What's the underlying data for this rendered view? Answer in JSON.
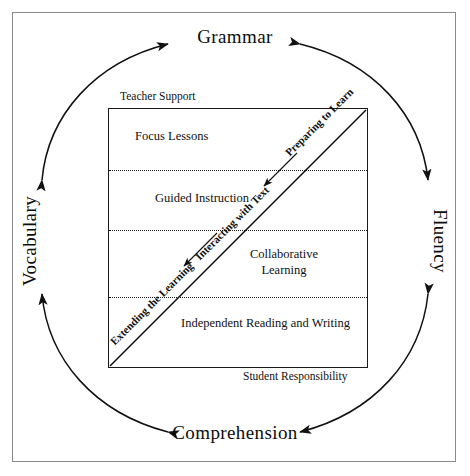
{
  "diagram": {
    "cycle": {
      "top_label": "Grammar",
      "bottom_label": "Comprehension",
      "left_label": "Vocabulary",
      "right_label": "Fluency"
    },
    "square": {
      "top_caption": "Teacher Support",
      "bottom_caption": "Student Responsibility",
      "bands": [
        {
          "label": "Focus Lessons"
        },
        {
          "label": "Guided Instruction"
        },
        {
          "label": "Collaborative Learning"
        },
        {
          "label": "Independent Reading and Writing"
        }
      ],
      "diagonal_labels": [
        {
          "label": "Preparing to Learn"
        },
        {
          "label": "Interacting with Text"
        },
        {
          "label": "Extending the Learning"
        }
      ]
    },
    "colors": {
      "ink": "#111111",
      "frame": "#8a8a8a",
      "background": "#ffffff"
    }
  }
}
